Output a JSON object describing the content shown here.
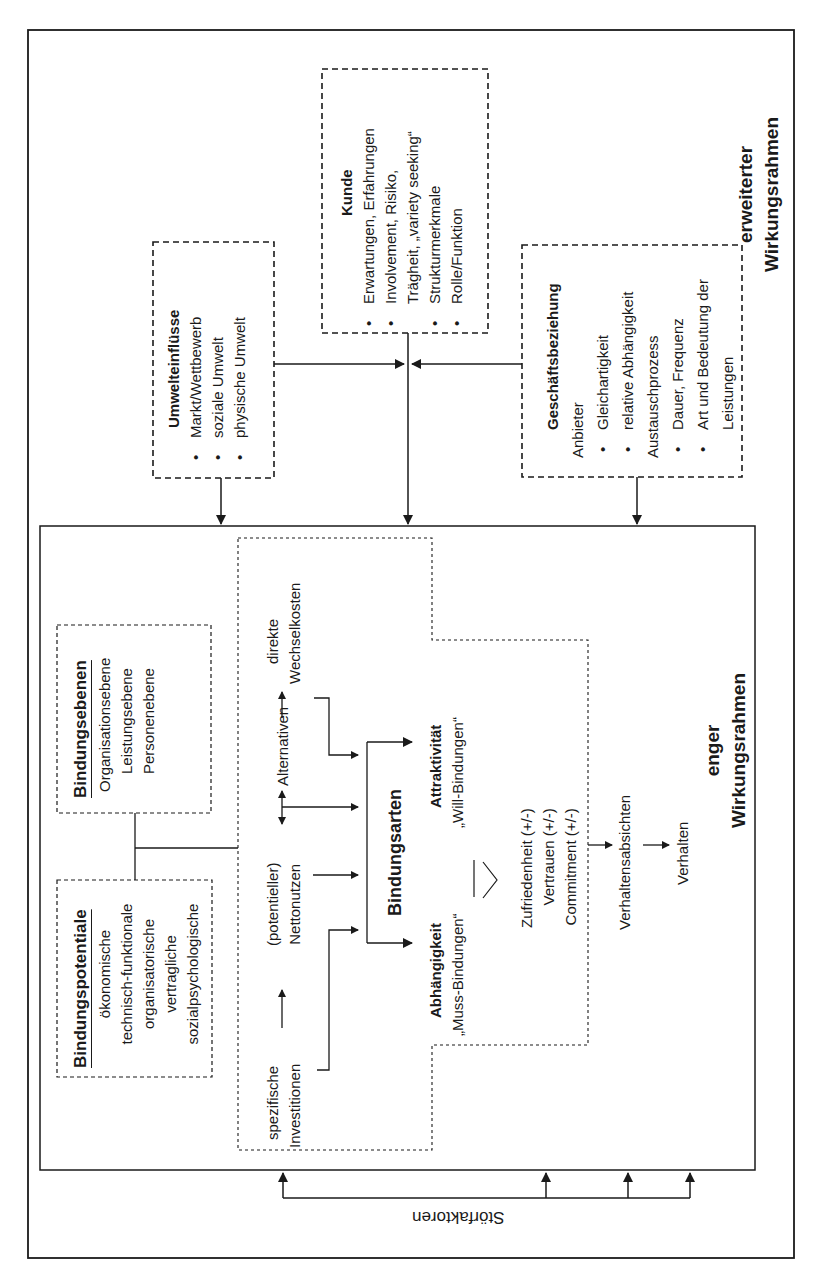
{
  "outer_frame": {
    "title_line1": "erweiterter",
    "title_line2": "Wirkungsrahmen"
  },
  "inner_frame": {
    "title_line1": "enger",
    "title_line2": "Wirkungsrahmen"
  },
  "kunde": {
    "title": "Kunde",
    "items": [
      "Erwartungen, Erfahrungen",
      "Involvement, Risiko,",
      "Trägheit, „variety seeking“",
      "Strukturmerkmale",
      "Rolle/Funktion"
    ]
  },
  "umwelteinfluesse": {
    "title": "Umwelteinflüsse",
    "items": [
      "Markt/Wettbewerb",
      "soziale Umwelt",
      "physische Umwelt"
    ]
  },
  "geschaeftsbeziehung": {
    "title": "Geschäftsbeziehung",
    "items": [
      "Anbieter",
      "Gleichartigkeit",
      "relative Abhängigkeit",
      "Austauschprozess",
      "Dauer, Frequenz",
      "Art und Bedeutung der",
      "Leistungen"
    ]
  },
  "bindungsebenen": {
    "title": "Bindungsebenen",
    "items": [
      "Organisationsebene",
      "Leistungsebene",
      "Personenebene"
    ]
  },
  "bindungspotentiale": {
    "title": "Bindungspotentiale",
    "items": [
      "ökonomische",
      "technisch-funktionale",
      "organisatorische",
      "vertragliche",
      "sozialpsychologische"
    ]
  },
  "drivers": {
    "spezifische": "spezifische",
    "investitionen": "Investitionen",
    "potentieller": "(potentieller)",
    "nettonutzen": "Nettonutzen",
    "alternativen": "Alternativen",
    "direkte": "direkte",
    "wechselkosten": "Wechselkosten"
  },
  "bindungsarten": {
    "title": "Bindungsarten",
    "abhaengigkeit": "Abhängigkeit",
    "muss": "„Muss-Bindungen“",
    "attraktivitaet": "Attraktivität",
    "will": "„Will-Bindungen“"
  },
  "mediators": [
    "Zufriedenheit (+/-)",
    "Vertrauen (+/-)",
    "Commitment (+/-)"
  ],
  "outcomes": {
    "absichten": "Verhaltensabsichten",
    "verhalten": "Verhalten"
  },
  "stoerfaktoren": "Störfaktoren"
}
